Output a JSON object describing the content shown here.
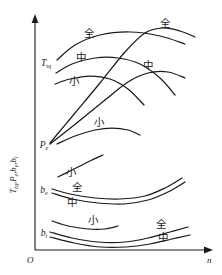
{
  "figure": {
    "background_color": "#ffffff",
    "line_color": "#1a1a1a"
  },
  "axes": {
    "origin_label": "O",
    "x_axis_label": "n",
    "y_axis_label_parts": [
      {
        "base": "T",
        "sub": "tq",
        "sep": ","
      },
      {
        "base": "P",
        "sub": "e",
        "sep": ","
      },
      {
        "base": "b",
        "sub": "e",
        "sep": ","
      },
      {
        "base": "b",
        "sub": "i",
        "sep": ""
      }
    ],
    "y_axis_label_plain": "T tq , P e , b e , b i",
    "x_range": [
      0,
      1
    ],
    "y_range": [
      0,
      1
    ],
    "grid": false,
    "ticks": []
  },
  "curve_group_labels": {
    "torque": {
      "base": "T",
      "sub": "tq"
    },
    "power": {
      "base": "P",
      "sub": "e"
    },
    "bsfc_effective": {
      "base": "b",
      "sub": "e"
    },
    "bsfc_indicated": {
      "base": "b",
      "sub": "i"
    }
  },
  "throttle_labels": {
    "full": "全",
    "medium": "中",
    "small": "小"
  },
  "chart_data": {
    "type": "line",
    "xlabel": "n",
    "ylabel": "T tq , P e , b e , b i",
    "xlim": [
      0,
      222
    ],
    "ylim": [
      0,
      275
    ],
    "grid": false,
    "legend": "inline-annotations",
    "series": [
      {
        "name": "T-tq-full",
        "group": "torque",
        "throttle": "全",
        "label": "全",
        "label_pos": [
          89,
          37
        ],
        "points": [
          [
            57,
            60
          ],
          [
            75,
            45
          ],
          [
            100,
            35
          ],
          [
            130,
            32
          ],
          [
            160,
            36
          ],
          [
            185,
            44
          ]
        ]
      },
      {
        "name": "T-tq-medium",
        "group": "torque",
        "throttle": "中",
        "label": "中",
        "label_pos": [
          81,
          61
        ],
        "points": [
          [
            56,
            73
          ],
          [
            72,
            64
          ],
          [
            95,
            58
          ],
          [
            118,
            58
          ],
          [
            140,
            64
          ],
          [
            160,
            78
          ],
          [
            175,
            95
          ]
        ]
      },
      {
        "name": "T-tq-small",
        "group": "torque",
        "throttle": "小",
        "label": "小",
        "label_pos": [
          74,
          85
        ],
        "points": [
          [
            55,
            84
          ],
          [
            70,
            79
          ],
          [
            90,
            76
          ],
          [
            110,
            79
          ],
          [
            128,
            89
          ],
          [
            144,
            105
          ]
        ]
      },
      {
        "name": "P-e-full",
        "group": "power",
        "throttle": "全",
        "label": "全",
        "label_pos": [
          165,
          27
        ],
        "points": [
          [
            50,
            143
          ],
          [
            75,
            113
          ],
          [
            100,
            83
          ],
          [
            125,
            52
          ],
          [
            145,
            33
          ],
          [
            163,
            28
          ],
          [
            180,
            31
          ],
          [
            195,
            37
          ]
        ]
      },
      {
        "name": "P-e-medium",
        "group": "power",
        "throttle": "中",
        "label": "中",
        "label_pos": [
          148,
          69
        ],
        "points": [
          [
            50,
            144
          ],
          [
            78,
            122
          ],
          [
            105,
            100
          ],
          [
            128,
            82
          ],
          [
            148,
            73
          ],
          [
            168,
            72
          ],
          [
            185,
            78
          ]
        ]
      },
      {
        "name": "P-e-small",
        "group": "power",
        "throttle": "小",
        "label": "小",
        "label_pos": [
          99,
          126
        ],
        "points": [
          [
            57,
            144
          ],
          [
            75,
            136
          ],
          [
            95,
            130
          ],
          [
            112,
            128
          ],
          [
            128,
            130
          ],
          [
            140,
            135
          ]
        ]
      },
      {
        "name": "b-e-small",
        "group": "bsfc_effective",
        "throttle": "小",
        "label": "小",
        "label_pos": [
          71,
          176
        ],
        "points": [
          [
            58,
            177
          ],
          [
            68,
            172
          ],
          [
            80,
            166
          ],
          [
            92,
            160
          ],
          [
            103,
            155
          ]
        ]
      },
      {
        "name": "b-e-full",
        "group": "bsfc_effective",
        "throttle": "全",
        "label": "全",
        "label_pos": [
          77,
          191
        ],
        "points": [
          [
            52,
            189
          ],
          [
            70,
            194
          ],
          [
            95,
            198
          ],
          [
            120,
            199
          ],
          [
            145,
            196
          ],
          [
            165,
            188
          ],
          [
            182,
            178
          ]
        ]
      },
      {
        "name": "b-e-medium",
        "group": "bsfc_effective",
        "throttle": "中",
        "label": "中",
        "label_pos": [
          72,
          206
        ],
        "points": [
          [
            52,
            193
          ],
          [
            72,
            199
          ],
          [
            98,
            203
          ],
          [
            124,
            204
          ],
          [
            148,
            200
          ],
          [
            168,
            192
          ],
          [
            185,
            182
          ]
        ]
      },
      {
        "name": "b-i-small",
        "group": "bsfc_indicated",
        "throttle": "小",
        "label": "小",
        "label_pos": [
          93,
          224
        ],
        "points": [
          [
            52,
            221
          ],
          [
            68,
            226
          ],
          [
            88,
            229
          ],
          [
            105,
            229
          ],
          [
            118,
            226
          ]
        ]
      },
      {
        "name": "b-i-full",
        "group": "bsfc_indicated",
        "throttle": "全",
        "label": "全",
        "label_pos": [
          161,
          228
        ],
        "points": [
          [
            50,
            232
          ],
          [
            72,
            238
          ],
          [
            98,
            242
          ],
          [
            125,
            242
          ],
          [
            148,
            238
          ],
          [
            170,
            232
          ],
          [
            188,
            227
          ]
        ]
      },
      {
        "name": "b-i-medium",
        "group": "bsfc_indicated",
        "throttle": "中",
        "label": "中",
        "label_pos": [
          163,
          241
        ],
        "points": [
          [
            50,
            237
          ],
          [
            74,
            243
          ],
          [
            100,
            247
          ],
          [
            126,
            247
          ],
          [
            150,
            244
          ],
          [
            172,
            239
          ],
          [
            190,
            235
          ]
        ]
      }
    ]
  }
}
